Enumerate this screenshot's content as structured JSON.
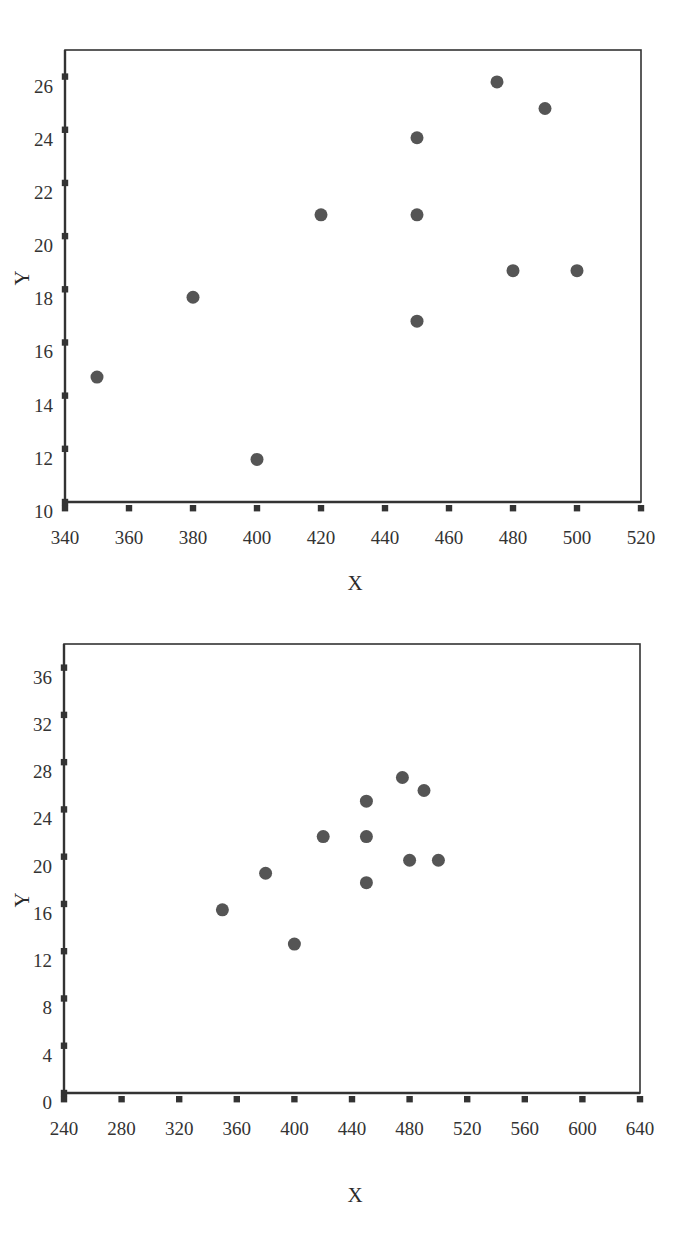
{
  "page": {
    "background_color": "#ffffff",
    "marker_color": "#555555",
    "axis_color": "#333333"
  },
  "chart_data": [
    {
      "id": "scatter-top",
      "type": "scatter",
      "title": "",
      "xlabel": "X",
      "ylabel": "Y",
      "xlim": [
        340,
        520
      ],
      "ylim": [
        10,
        27
      ],
      "xticks": [
        340,
        360,
        380,
        400,
        420,
        440,
        460,
        480,
        500,
        520
      ],
      "yticks": [
        10,
        12,
        14,
        16,
        18,
        20,
        22,
        24,
        26
      ],
      "xtick_labels": [
        "340",
        "360",
        "380",
        "400",
        "420",
        "440",
        "460",
        "480",
        "500",
        "520"
      ],
      "ytick_labels": [
        "10",
        "12",
        "14",
        "16",
        "18",
        "20",
        "22",
        "24",
        "26"
      ],
      "grid": false,
      "legend": false,
      "marker": "circle",
      "marker_size": 13,
      "marker_color": "#555555",
      "points": [
        {
          "x": 350,
          "y": 14.7
        },
        {
          "x": 380,
          "y": 17.7
        },
        {
          "x": 400,
          "y": 11.6
        },
        {
          "x": 420,
          "y": 20.8
        },
        {
          "x": 450,
          "y": 23.7
        },
        {
          "x": 450,
          "y": 20.8
        },
        {
          "x": 450,
          "y": 16.8
        },
        {
          "x": 475,
          "y": 25.8
        },
        {
          "x": 480,
          "y": 18.7
        },
        {
          "x": 490,
          "y": 24.8
        },
        {
          "x": 500,
          "y": 18.7
        }
      ]
    },
    {
      "id": "scatter-bottom",
      "type": "scatter",
      "title": "",
      "xlabel": "X",
      "ylabel": "Y",
      "xlim": [
        240,
        640
      ],
      "ylim": [
        0,
        38
      ],
      "xticks": [
        240,
        280,
        320,
        360,
        400,
        440,
        480,
        520,
        560,
        600,
        640
      ],
      "yticks": [
        0,
        4,
        8,
        12,
        16,
        20,
        24,
        28,
        32,
        36
      ],
      "xtick_labels": [
        "240",
        "280",
        "320",
        "360",
        "400",
        "440",
        "480",
        "520",
        "560",
        "600",
        "640"
      ],
      "ytick_labels": [
        "0",
        "4",
        "8",
        "12",
        "16",
        "20",
        "24",
        "28",
        "32",
        "36"
      ],
      "grid": false,
      "legend": false,
      "marker": "circle",
      "marker_size": 13,
      "marker_color": "#555555",
      "points": [
        {
          "x": 350,
          "y": 15.5
        },
        {
          "x": 380,
          "y": 18.6
        },
        {
          "x": 400,
          "y": 12.6
        },
        {
          "x": 420,
          "y": 21.7
        },
        {
          "x": 450,
          "y": 24.7
        },
        {
          "x": 450,
          "y": 21.7
        },
        {
          "x": 450,
          "y": 17.8
        },
        {
          "x": 475,
          "y": 26.7
        },
        {
          "x": 480,
          "y": 19.7
        },
        {
          "x": 490,
          "y": 25.6
        },
        {
          "x": 500,
          "y": 19.7
        }
      ]
    }
  ]
}
